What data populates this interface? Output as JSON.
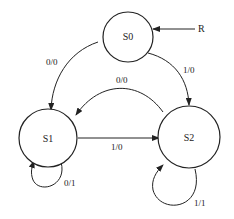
{
  "diagram": {
    "type": "state-machine",
    "states": [
      {
        "id": "S0",
        "label": "S0"
      },
      {
        "id": "S1",
        "label": "S1"
      },
      {
        "id": "S2",
        "label": "S2"
      }
    ],
    "reset": {
      "label": "R",
      "target": "S0"
    },
    "transitions": [
      {
        "from": "S0",
        "to": "S1",
        "label": "0/0"
      },
      {
        "from": "S0",
        "to": "S2",
        "label": "1/0"
      },
      {
        "from": "S2",
        "to": "S1",
        "label": "0/0"
      },
      {
        "from": "S1",
        "to": "S2",
        "label": "1/0"
      },
      {
        "from": "S1",
        "to": "S1",
        "label": "0/1"
      },
      {
        "from": "S2",
        "to": "S2",
        "label": "1/1"
      }
    ]
  }
}
